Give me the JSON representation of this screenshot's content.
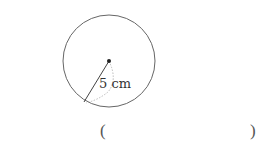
{
  "figure": {
    "shape": "circle",
    "radius_label": "5 cm",
    "radius_value": 5,
    "radius_unit": "cm"
  },
  "answer": {
    "open_paren": "(",
    "close_paren": ")",
    "value": ""
  },
  "colors": {
    "stroke": "#555555",
    "center_dot": "#222222",
    "dotted": "#aaaaaa"
  }
}
